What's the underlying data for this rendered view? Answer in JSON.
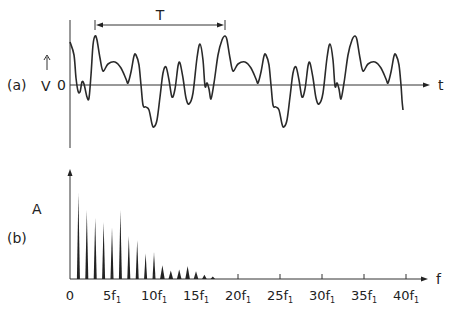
{
  "panel_a": {
    "label": "(a)",
    "y_label": "V",
    "zero_label": "0",
    "x_label": "t",
    "period_label": "T",
    "period_start_x": 95,
    "period_end_x": 225,
    "origin_x": 70,
    "zero_y": 85,
    "axis_top_y": 20,
    "axis_bottom_y": 148,
    "axis_end_x": 430,
    "wave_points": [
      [
        70,
        42
      ],
      [
        74,
        55
      ],
      [
        76,
        78
      ],
      [
        78,
        91
      ],
      [
        80,
        92
      ],
      [
        82,
        82
      ],
      [
        84,
        84
      ],
      [
        87,
        97
      ],
      [
        89,
        98
      ],
      [
        91,
        75
      ],
      [
        93,
        45
      ],
      [
        95,
        36
      ],
      [
        97,
        40
      ],
      [
        100,
        58
      ],
      [
        103,
        71
      ],
      [
        108,
        64
      ],
      [
        115,
        62
      ],
      [
        121,
        68
      ],
      [
        126,
        79
      ],
      [
        128,
        83
      ],
      [
        131,
        72
      ],
      [
        134,
        56
      ],
      [
        136,
        55
      ],
      [
        139,
        65
      ],
      [
        141,
        85
      ],
      [
        143,
        105
      ],
      [
        146,
        107
      ],
      [
        149,
        110
      ],
      [
        152,
        124
      ],
      [
        154,
        127
      ],
      [
        157,
        120
      ],
      [
        160,
        97
      ],
      [
        163,
        73
      ],
      [
        166,
        67
      ],
      [
        169,
        80
      ],
      [
        172,
        97
      ],
      [
        175,
        89
      ],
      [
        178,
        66
      ],
      [
        180,
        63
      ],
      [
        183,
        78
      ],
      [
        186,
        98
      ],
      [
        189,
        104
      ],
      [
        193,
        93
      ],
      [
        197,
        58
      ],
      [
        200,
        44
      ],
      [
        203,
        60
      ],
      [
        205,
        86
      ],
      [
        207,
        83
      ],
      [
        209,
        89
      ],
      [
        211,
        99
      ],
      [
        214,
        83
      ],
      [
        218,
        55
      ],
      [
        222,
        40
      ],
      [
        225,
        36
      ],
      [
        227,
        40
      ],
      [
        230,
        58
      ],
      [
        233,
        71
      ],
      [
        238,
        64
      ],
      [
        245,
        62
      ],
      [
        251,
        68
      ],
      [
        256,
        79
      ],
      [
        258,
        83
      ],
      [
        261,
        72
      ],
      [
        264,
        56
      ],
      [
        266,
        55
      ],
      [
        269,
        65
      ],
      [
        271,
        85
      ],
      [
        273,
        105
      ],
      [
        276,
        107
      ],
      [
        279,
        110
      ],
      [
        282,
        124
      ],
      [
        284,
        127
      ],
      [
        287,
        120
      ],
      [
        290,
        97
      ],
      [
        293,
        73
      ],
      [
        296,
        67
      ],
      [
        299,
        80
      ],
      [
        302,
        97
      ],
      [
        305,
        89
      ],
      [
        308,
        66
      ],
      [
        310,
        63
      ],
      [
        313,
        78
      ],
      [
        316,
        98
      ],
      [
        319,
        104
      ],
      [
        323,
        93
      ],
      [
        327,
        58
      ],
      [
        330,
        44
      ],
      [
        333,
        60
      ],
      [
        335,
        86
      ],
      [
        337,
        83
      ],
      [
        339,
        89
      ],
      [
        341,
        99
      ],
      [
        344,
        83
      ],
      [
        348,
        55
      ],
      [
        352,
        40
      ],
      [
        355,
        36
      ],
      [
        357,
        40
      ],
      [
        360,
        58
      ],
      [
        363,
        71
      ],
      [
        368,
        64
      ],
      [
        375,
        62
      ],
      [
        381,
        68
      ],
      [
        386,
        79
      ],
      [
        388,
        83
      ],
      [
        391,
        72
      ],
      [
        394,
        56
      ],
      [
        396,
        55
      ],
      [
        399,
        65
      ],
      [
        401,
        85
      ],
      [
        402,
        100
      ],
      [
        403,
        110
      ]
    ]
  },
  "panel_b": {
    "label": "(b)",
    "y_label": "A",
    "x_label": "f",
    "origin_x": 70,
    "baseline_y": 279,
    "axis_top_y": 169,
    "axis_end_x": 428,
    "px_per_harmonic": 8.4
  },
  "chart_data": {
    "type": "bar",
    "title": "",
    "subplots": [
      {
        "id": "a",
        "type": "line",
        "description": "Periodic voltage waveform V(t) with period T",
        "xlabel": "t",
        "ylabel": "V",
        "annotations": [
          "T",
          "0"
        ],
        "grid": false
      },
      {
        "id": "b",
        "type": "bar",
        "description": "Amplitude spectrum A at harmonics of f1",
        "xlabel": "f",
        "ylabel": "A",
        "x_tick_labels": [
          "0",
          "5f1",
          "10f1",
          "15f1",
          "20f1",
          "25f1",
          "30f1",
          "35f1",
          "40f1"
        ],
        "x_ticks": [
          0,
          5,
          10,
          15,
          20,
          25,
          30,
          35,
          40
        ],
        "harmonics": [
          1,
          2,
          3,
          4,
          5,
          6,
          7,
          8,
          9,
          10,
          11,
          12,
          13,
          14,
          15,
          16,
          17
        ],
        "values": [
          100,
          80,
          71,
          66,
          60,
          80,
          50,
          45,
          30,
          31,
          16,
          10,
          11,
          15,
          9,
          5,
          3
        ],
        "ylim": [
          0,
          120
        ],
        "grid": false
      }
    ]
  },
  "x_tick_labels": [
    {
      "main": "0",
      "sub": ""
    },
    {
      "main": "5f",
      "sub": "1"
    },
    {
      "main": "10f",
      "sub": "1"
    },
    {
      "main": "15f",
      "sub": "1"
    },
    {
      "main": "20f",
      "sub": "1"
    },
    {
      "main": "25f",
      "sub": "1"
    },
    {
      "main": "30f",
      "sub": "1"
    },
    {
      "main": "35f",
      "sub": "1"
    },
    {
      "main": "40f",
      "sub": "1"
    }
  ]
}
